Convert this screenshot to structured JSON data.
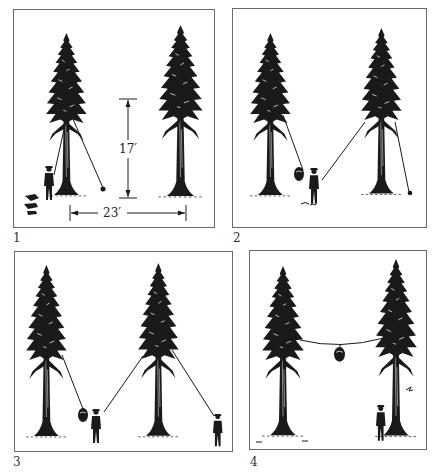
{
  "figure": {
    "ink_color": "#1a1a1a",
    "paper_color": "#ffffff",
    "frame_color": "#6a6a6a"
  },
  "panels": [
    {
      "number": "1",
      "elements": [
        "left-tree",
        "right-tree",
        "person",
        "rope-with-weight",
        "height-dimension",
        "spacing-dimension"
      ],
      "dimensions": {
        "height_label": "17′",
        "spacing_label": "23′"
      }
    },
    {
      "number": "2",
      "elements": [
        "left-tree",
        "right-tree",
        "person-with-bag",
        "rope-over-left-branch",
        "rope-over-right-branch"
      ]
    },
    {
      "number": "3",
      "elements": [
        "left-tree",
        "right-tree",
        "person-with-bag",
        "second-person",
        "ropes"
      ]
    },
    {
      "number": "4",
      "elements": [
        "left-tree",
        "right-tree",
        "suspended-bag",
        "person-at-tree",
        "rope-between-trees"
      ]
    }
  ]
}
